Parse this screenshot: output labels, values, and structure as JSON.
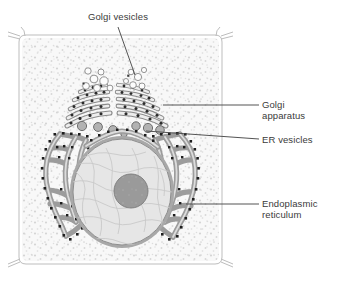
{
  "figure": {
    "type": "biology-cell-diagram",
    "background_color": "#ffffff"
  },
  "labels": {
    "golgi_vesicles": "Golgi vesicles",
    "golgi_apparatus": "Golgi\napparatus",
    "er_vesicles": "ER vesicles",
    "endoplasmic_reticulum": "Endoplasmic\nreticulum"
  },
  "structures": {
    "cell_wall": {
      "name": "cell-wall",
      "stroke": "#b9b9b9"
    },
    "cytoplasm": {
      "name": "cytoplasm",
      "fill": "#f7f7f7",
      "stipple": "#d2d2d2"
    },
    "nucleus": {
      "name": "nucleus",
      "fill": "#e3e3e3",
      "stroke": "#8c8c8c",
      "chromatin": "#c9c9c9"
    },
    "nucleolus": {
      "name": "nucleolus",
      "fill": "#9a9a9a",
      "stroke": "#7d7d7d"
    },
    "golgi_cisternae": {
      "name": "golgi-cisternae",
      "fill": "#ececec",
      "stroke": "#808080",
      "granule": "#2b2b2b"
    },
    "golgi_vesicles": {
      "name": "golgi-vesicles",
      "fill": "#fdfdfd",
      "stroke": "#8a8a8a"
    },
    "er_vesicles": {
      "name": "er-vesicles",
      "fill": "#b4b4b4",
      "stroke": "#6e6e6e"
    },
    "endoplasmic_reticulum": {
      "name": "rough-er",
      "fill": "#9e9e9e",
      "stroke": "#6b6b6b",
      "ribosome": "#1f1f1f"
    }
  },
  "colors": {
    "text": "#3a3a3a",
    "leader_line": "#4a4a4a"
  }
}
